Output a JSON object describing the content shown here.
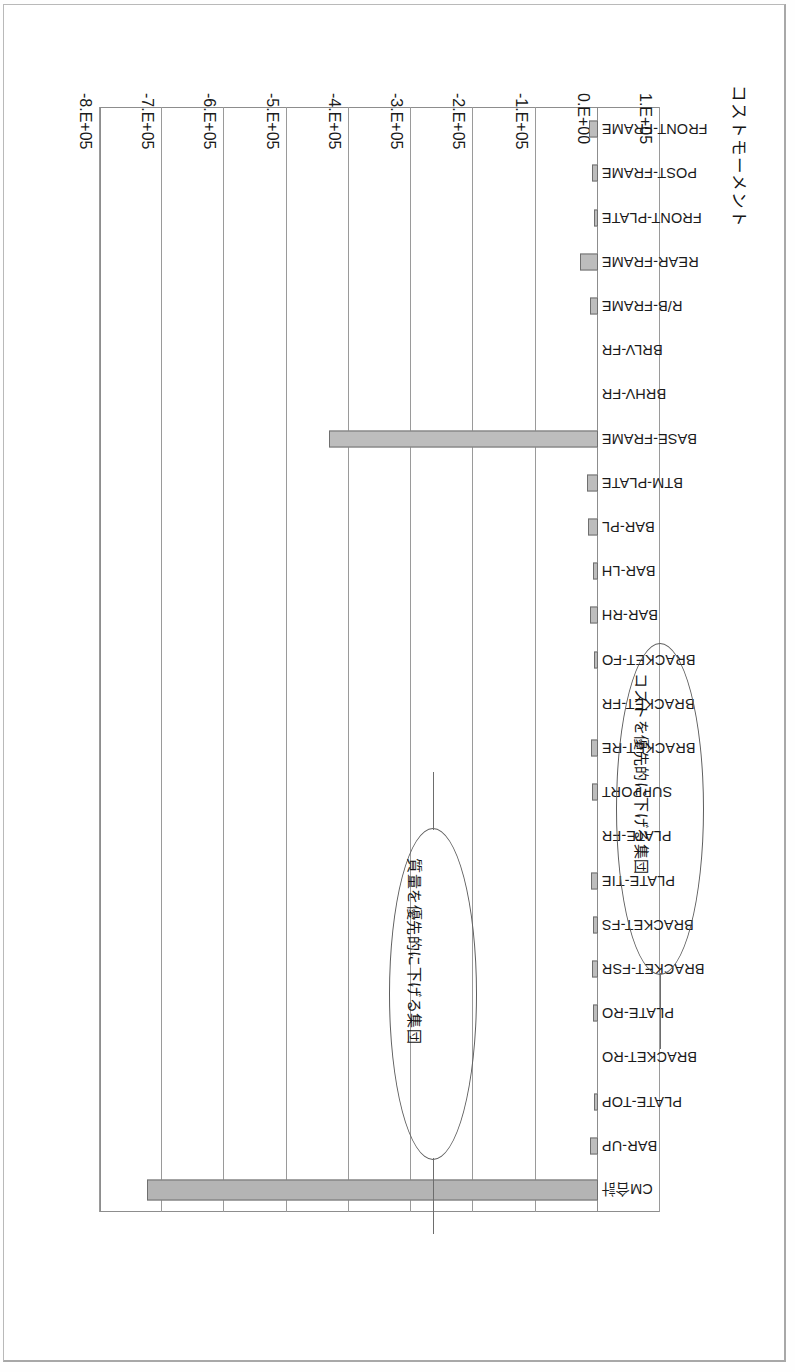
{
  "page": {
    "orientation": "rotated-180",
    "background": "#ffffff",
    "border_color": "#b9b9b9"
  },
  "chart_data": {
    "type": "bar",
    "orientation": "horizontal",
    "title": "コストモーメント",
    "xlabel": "",
    "ylabel": "",
    "grid": true,
    "legend": "none",
    "xlim": [
      100000,
      -800000
    ],
    "xticks": [
      "1.E+05",
      "0.E+00",
      "-1.E+05",
      "-2.E+05",
      "-3.E+05",
      "-4.E+05",
      "-5.E+05",
      "-6.E+05",
      "-7.E+05",
      "-8.E+05"
    ],
    "xtick_values": [
      100000,
      0,
      -100000,
      -200000,
      -300000,
      -400000,
      -500000,
      -600000,
      -700000,
      -800000
    ],
    "categories": [
      "FRONT-FRAME",
      "POST-FRAME",
      "FRONT-PLATE",
      "REAR-FRAME",
      "R/B-FRAME",
      "BRLV-FR",
      "BRHV-FR",
      "BASE-FRAME",
      "BTM-PLATE",
      "BAR-PL",
      "BAR-LH",
      "BAR-RH",
      "BRACKET-FO",
      "BRACKET-FR",
      "BRACKET-RE",
      "SUPPORT",
      "PLATE-FR",
      "PLATE-TIE",
      "BRACKET-FS",
      "BRACKET-FSR",
      "PLATE-RO",
      "BRACKET-RO",
      "PLATE-TOP",
      "BAR-UP",
      "CM合計"
    ],
    "values": [
      -14000,
      -9000,
      -5000,
      -28000,
      -13000,
      0,
      0,
      -432000,
      -17000,
      -15000,
      -8000,
      -13000,
      -6000,
      0,
      -11000,
      -10000,
      0,
      -11000,
      -7000,
      -9000,
      -8000,
      0,
      -6000,
      -12000,
      -725000
    ],
    "bar_color": "#bdbdbd",
    "bar_edge_color": "#6f6f6f",
    "annotations": [
      {
        "id": "cost-group",
        "text": "コストを優先的に下げる集団",
        "points_at": "BASE-FRAME"
      },
      {
        "id": "mass-group",
        "text": "質量を優先的に下げる集団",
        "points_at": "BRACKET-RO"
      }
    ]
  }
}
